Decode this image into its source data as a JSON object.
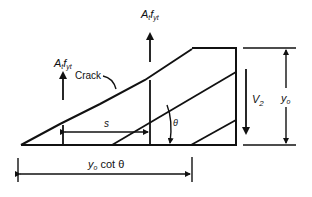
{
  "diagram": {
    "labels": {
      "force_top": {
        "base": "A",
        "sub1": "t",
        "mid": "f",
        "sub2": "yt"
      },
      "force_left": {
        "base": "A",
        "sub1": "t",
        "mid": "f",
        "sub2": "yt"
      },
      "crack": "Crack",
      "spacing": "s",
      "angle": "θ",
      "shear": {
        "base": "V",
        "sub": "2"
      },
      "height": {
        "base": "y",
        "sub": "o"
      },
      "projection": {
        "base": "y",
        "sub": "o",
        "rest": " cot θ"
      }
    },
    "colors": {
      "line": "#111111",
      "background": "#ffffff"
    }
  }
}
